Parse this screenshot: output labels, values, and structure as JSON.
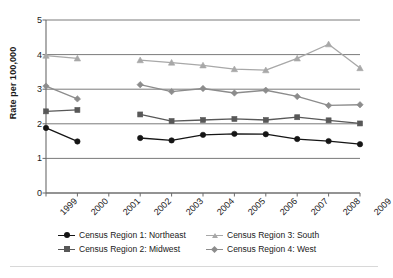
{
  "chart_data": {
    "type": "line",
    "title": "",
    "subtitle": "",
    "xlabel": "",
    "ylabel": "Rate per 100,000",
    "categories": [
      "1999",
      "2000",
      "2001",
      "2002",
      "2003",
      "2004",
      "2005",
      "2006",
      "2007",
      "2008",
      "2009"
    ],
    "x": [
      1999,
      2000,
      2001,
      2002,
      2003,
      2004,
      2005,
      2006,
      2007,
      2008,
      2009
    ],
    "ylim": [
      0,
      5
    ],
    "yticks": [
      0,
      1,
      2,
      3,
      4,
      5
    ],
    "ytick_labels": [
      "0",
      "1",
      "2",
      "3",
      "4",
      "5"
    ],
    "grid": "horizontal",
    "legend_position": "bottom",
    "series": [
      {
        "name": "Census Region 1: Northeast",
        "short_name": "Northeast",
        "marker": "circle",
        "color": "#151515",
        "values": [
          1.88,
          1.49,
          null,
          1.59,
          1.52,
          1.68,
          1.71,
          1.7,
          1.56,
          1.5,
          1.41
        ]
      },
      {
        "name": "Census Region 2: Midwest",
        "short_name": "Midwest",
        "marker": "square",
        "color": "#585858",
        "values": [
          2.36,
          2.4,
          null,
          2.27,
          2.08,
          2.11,
          2.14,
          2.11,
          2.19,
          2.1,
          2.01
        ]
      },
      {
        "name": "Census Region 3: South",
        "short_name": "South",
        "marker": "triangle",
        "color": "#a8a8a8",
        "values": [
          3.97,
          3.89,
          null,
          3.84,
          3.77,
          3.69,
          3.58,
          3.55,
          3.89,
          4.3,
          3.61
        ]
      },
      {
        "name": "Census Region 4: West",
        "short_name": "West",
        "marker": "diamond",
        "color": "#8c8c8c",
        "values": [
          3.09,
          2.72,
          null,
          3.13,
          2.93,
          3.02,
          2.89,
          2.97,
          2.79,
          2.53,
          2.55
        ]
      }
    ]
  },
  "axes": {
    "y_title": "Rate per 100,000"
  },
  "legend": {
    "entries": [
      {
        "label": "Census Region 1: Northeast"
      },
      {
        "label": "Census Region 3: South"
      },
      {
        "label": "Census Region 2: Midwest"
      },
      {
        "label": "Census Region 4: West"
      }
    ]
  }
}
